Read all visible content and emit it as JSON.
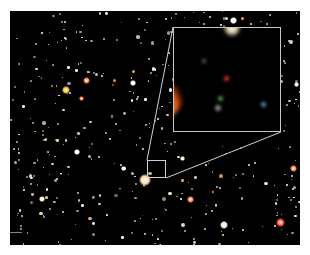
{
  "image": {
    "description": "Deep-field astronomical image with a magnified inset of a small region",
    "background_color": "#000000",
    "inset": {
      "border_color": "#c8c8c8",
      "sources": [
        {
          "color": "#f0e4c0",
          "x": 58,
          "y": 0,
          "size": 18
        },
        {
          "color": "#3f5a4a",
          "x": 30,
          "y": 33,
          "size": 6
        },
        {
          "color": "#c8301c",
          "x": 52,
          "y": 50,
          "size": 7
        },
        {
          "color": "#4c8a3c",
          "x": 46,
          "y": 70,
          "size": 7
        },
        {
          "color": "#7a8a90",
          "x": 44,
          "y": 80,
          "size": 8
        },
        {
          "color": "#5a7ca0",
          "x": 89,
          "y": 76,
          "size": 7
        },
        {
          "color": "#ff9a30",
          "x": -14,
          "y": 68,
          "size": 46
        }
      ]
    },
    "zoom_box": {
      "x": 147,
      "y": 160,
      "w": 19,
      "h": 18
    },
    "bright_sources": [
      {
        "color": "#ffd8a0",
        "x": 145,
        "y": 180,
        "size": 12
      },
      {
        "color": "#ff7a40",
        "x": 86,
        "y": 80,
        "size": 7
      },
      {
        "color": "#ff7040",
        "x": 81,
        "y": 98,
        "size": 5
      },
      {
        "color": "#f0c040",
        "x": 66,
        "y": 90,
        "size": 8
      },
      {
        "color": "#ff8050",
        "x": 190,
        "y": 199,
        "size": 7
      },
      {
        "color": "#ff5030",
        "x": 280,
        "y": 222,
        "size": 9
      },
      {
        "color": "#ff8040",
        "x": 293,
        "y": 168,
        "size": 7
      },
      {
        "color": "#ffffff",
        "x": 233,
        "y": 20,
        "size": 7
      },
      {
        "color": "#ffffff",
        "x": 77,
        "y": 152,
        "size": 6
      },
      {
        "color": "#fff4d0",
        "x": 42,
        "y": 199,
        "size": 6
      },
      {
        "color": "#ffffff",
        "x": 133,
        "y": 83,
        "size": 6
      },
      {
        "color": "#e0f0d0",
        "x": 224,
        "y": 225,
        "size": 8
      },
      {
        "color": "#fff0c0",
        "x": 182,
        "y": 158,
        "size": 5
      },
      {
        "color": "#ffffff",
        "x": 296,
        "y": 84,
        "size": 5
      },
      {
        "color": "#ffffff",
        "x": 123,
        "y": 168,
        "size": 5
      }
    ]
  }
}
